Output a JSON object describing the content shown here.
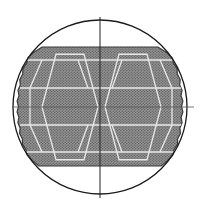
{
  "diagram": {
    "type": "tube-sheet-layout",
    "canvas": {
      "width": 207,
      "height": 210,
      "background": "#ffffff"
    },
    "outer_circle": {
      "cx": 100,
      "cy": 107,
      "r": 87,
      "stroke": "#1a1a1a",
      "stroke_width": 1.3
    },
    "axes": {
      "vertical": {
        "x": 100,
        "y1": 17,
        "y2": 198,
        "stroke": "#222222"
      },
      "horizontal": {
        "y": 107,
        "x1": 12,
        "x2": 194,
        "stroke": "#555555"
      }
    },
    "tube_field": {
      "fill": "#8a8a8a",
      "dot_color": "#5c5c5c",
      "edge_color": "#3a3a3a",
      "top_y": 47,
      "bottom_y": 166,
      "top_left_x": 42,
      "top_right_x": 158,
      "bottom_left_x": 42,
      "bottom_right_x": 158,
      "left_bulge_x": 17,
      "right_bulge_x": 183
    },
    "lane_grid": {
      "color": "#f2f2f2",
      "description": "white pass-partition lanes forming hexagonal cells"
    }
  }
}
